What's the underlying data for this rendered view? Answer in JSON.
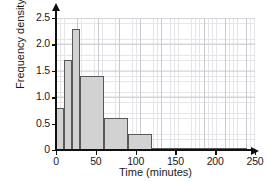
{
  "chart_data": {
    "type": "bar",
    "title": "",
    "subtitle": "",
    "xlabel": "Time (minutes)",
    "ylabel": "Frequency density",
    "xlim": [
      0,
      250
    ],
    "ylim": [
      0,
      2.5
    ],
    "grid": true,
    "legend": false,
    "legend_position": "none",
    "x_ticks": [
      0,
      50,
      100,
      150,
      200,
      250
    ],
    "x_tick_labels": [
      "0",
      "50",
      "100",
      "150",
      "200",
      "250"
    ],
    "y_ticks": [
      0,
      0.5,
      1.0,
      1.5,
      2.0,
      2.5
    ],
    "y_tick_labels": [
      "0",
      "0.5",
      "1.0",
      "1.5",
      "2.0",
      "2.5"
    ],
    "bin_edges": [
      0,
      10,
      20,
      30,
      60,
      90,
      120,
      240
    ],
    "categories": [
      "0-10",
      "10-20",
      "20-30",
      "30-60",
      "60-90",
      "90-120",
      "120-240"
    ],
    "values": [
      0.8,
      1.7,
      2.3,
      1.4,
      0.6,
      0.3,
      0.03
    ],
    "bars": [
      {
        "label": "0-10",
        "x0": 0,
        "x1": 10,
        "value": 0.8
      },
      {
        "label": "10-20",
        "x0": 10,
        "x1": 20,
        "value": 1.7
      },
      {
        "label": "20-30",
        "x0": 20,
        "x1": 30,
        "value": 2.3
      },
      {
        "label": "30-60",
        "x0": 30,
        "x1": 60,
        "value": 1.4
      },
      {
        "label": "60-90",
        "x0": 60,
        "x1": 90,
        "value": 0.6
      },
      {
        "label": "90-120",
        "x0": 90,
        "x1": 120,
        "value": 0.3
      },
      {
        "label": "120-240",
        "x0": 120,
        "x1": 240,
        "value": 0.03
      }
    ],
    "colors": {
      "bar_fill": "#d2d2d2",
      "bar_stroke": "#595959",
      "axis": "#111111",
      "grid_minor": "#e6e6ea",
      "grid_major": "#c9c9d0",
      "background": "#ffffff"
    }
  }
}
